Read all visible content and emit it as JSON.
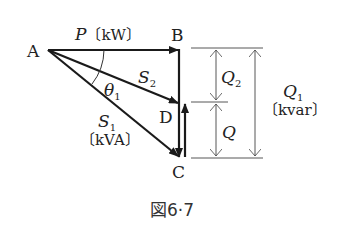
{
  "diagram": {
    "type": "power-triangle-vector-diagram",
    "points": {
      "A": "A",
      "B": "B",
      "C": "C",
      "D": "D"
    },
    "labels": {
      "P": "P",
      "P_unit": "〔kW〕",
      "S1": "S",
      "S1_sub": "1",
      "S1_unit": "〔kVA〕",
      "S2": "S",
      "S2_sub": "2",
      "theta": "θ",
      "theta_sub": "1",
      "Q": "Q",
      "Q2": "Q",
      "Q2_sub": "2",
      "Q1": "Q",
      "Q1_sub": "1",
      "Q1_unit": "〔kvar〕"
    },
    "caption": "図6·7",
    "colors": {
      "line": "#1a1a1a",
      "dim_line": "#444444",
      "text": "#222222"
    }
  }
}
